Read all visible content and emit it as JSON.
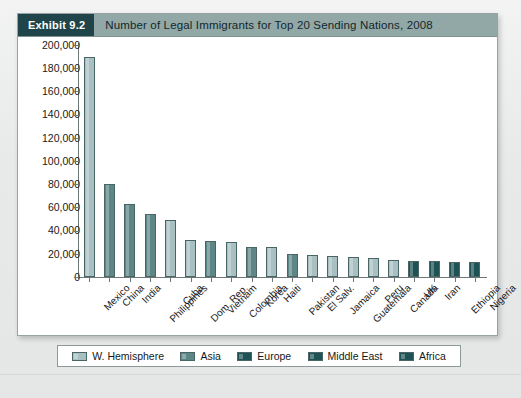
{
  "exhibit": {
    "tag": "Exhibit 9.2",
    "title": "Number of Legal Immigrants for Top 20 Sending Nations, 2008"
  },
  "colors": {
    "header_bar": "#91a8a7",
    "header_tag": "#1f4449",
    "w_hemisphere": "#a9c0c2",
    "asia": "#5d8687",
    "europe": "#1f5255",
    "middle_east": "#1f5255",
    "africa": "#1f5255",
    "axis": "#6e7878",
    "page_background": "#eceeed"
  },
  "legend": {
    "items": [
      {
        "label": "W. Hemisphere",
        "key": "grp-wh"
      },
      {
        "label": "Asia",
        "key": "grp-as"
      },
      {
        "label": "Europe",
        "key": "grp-eu"
      },
      {
        "label": "Middle East",
        "key": "grp-me"
      },
      {
        "label": "Africa",
        "key": "grp-af"
      }
    ]
  },
  "chart_data": {
    "type": "bar",
    "title": "Number of Legal Immigrants for Top 20 Sending Nations, 2008",
    "xlabel": "",
    "ylabel": "",
    "ylim": [
      0,
      200000
    ],
    "ytick_step": 20000,
    "grid": false,
    "legend_position": "bottom",
    "ytick_labels": [
      "200,000",
      "180,000",
      "160,000",
      "140,000",
      "120,000",
      "100,000",
      "80,000",
      "60,000",
      "40,000",
      "20,000",
      "0"
    ],
    "categories": [
      "Mexico",
      "China",
      "India",
      "Philippines",
      "Cuba",
      "Dom. Rep.",
      "Vietnam",
      "Colombia",
      "Korea",
      "Haiti",
      "Pakistan",
      "El Salv.",
      "Jamaica",
      "Guatemala",
      "Peru",
      "Canada",
      "UK",
      "Iran",
      "Ethiopia",
      "Nigeria"
    ],
    "values": [
      190000,
      80000,
      63000,
      54000,
      49000,
      32000,
      31000,
      30000,
      26000,
      26000,
      20000,
      19000,
      18000,
      17000,
      16000,
      15000,
      14000,
      14000,
      13000,
      13000
    ],
    "groups": [
      "W. Hemisphere",
      "Asia",
      "Asia",
      "Asia",
      "W. Hemisphere",
      "W. Hemisphere",
      "Asia",
      "W. Hemisphere",
      "Asia",
      "W. Hemisphere",
      "Asia",
      "W. Hemisphere",
      "W. Hemisphere",
      "W. Hemisphere",
      "W. Hemisphere",
      "W. Hemisphere",
      "Europe",
      "Middle East",
      "Africa",
      "Africa"
    ],
    "group_classes": [
      "grp-wh",
      "grp-as",
      "grp-as",
      "grp-as",
      "grp-wh",
      "grp-wh",
      "grp-as",
      "grp-wh",
      "grp-as",
      "grp-wh",
      "grp-as",
      "grp-wh",
      "grp-wh",
      "grp-wh",
      "grp-wh",
      "grp-wh",
      "grp-eu",
      "grp-me",
      "grp-af",
      "grp-af"
    ]
  }
}
